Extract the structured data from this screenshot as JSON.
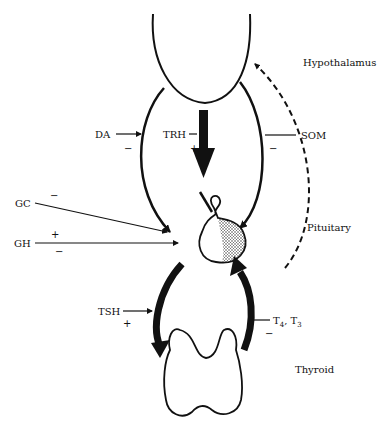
{
  "organs": {
    "hypothalamus": "Hypothalamus",
    "pituitary": "Pituitary",
    "thyroid": "Thyroid"
  },
  "hormones": {
    "da": "DA",
    "trh": "TRH",
    "som": "SOM",
    "gc": "GC",
    "gh": "GH",
    "tsh": "TSH",
    "t4": "T",
    "t4_sub": "4",
    "t3_sep": ", T",
    "t3_sub": "3"
  },
  "signs": {
    "da": "−",
    "trh": "+",
    "som": "−",
    "gc": "−",
    "gh_plus": "+",
    "gh_minus": "−",
    "tsh": "+",
    "t4t3": "−"
  },
  "colors": {
    "ink": "#111111",
    "background": "#ffffff"
  }
}
